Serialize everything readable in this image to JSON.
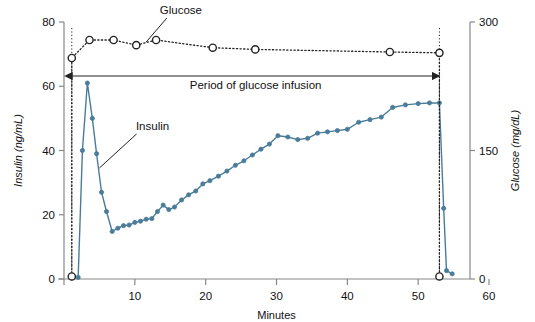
{
  "chart_data": {
    "type": "line",
    "title": "",
    "xlabel": "Minutes",
    "ylabel": "Insulin (ng/mL)",
    "y2label": "Glucose (mg/dL)",
    "xlim": [
      0,
      60
    ],
    "ylim": [
      0,
      80
    ],
    "y2lim": [
      0,
      300
    ],
    "xticks": [
      "10",
      "20",
      "30",
      "40",
      "50",
      "60"
    ],
    "xtick_values": [
      10,
      20,
      30,
      40,
      50,
      60
    ],
    "yticks": [
      "0",
      "20",
      "40",
      "60",
      "80"
    ],
    "ytick_values": [
      0,
      20,
      40,
      60,
      80
    ],
    "y2ticks": [
      "0",
      "150",
      "300"
    ],
    "y2tick_values": [
      0,
      150,
      300
    ],
    "grid": false,
    "legend_position": "inline-annotations",
    "series": [
      {
        "name": "Insulin",
        "axis": "left",
        "units": "ng/mL",
        "color": "#4a7c99",
        "marker": "filled-circle",
        "linestyle": "solid",
        "points": [
          [
            2.0,
            0.5
          ],
          [
            2.6,
            40.0
          ],
          [
            3.3,
            61.0
          ],
          [
            4.0,
            50.0
          ],
          [
            4.6,
            39.0
          ],
          [
            5.3,
            27.0
          ],
          [
            6.0,
            21.0
          ],
          [
            6.8,
            14.8
          ],
          [
            7.6,
            15.8
          ],
          [
            8.4,
            16.6
          ],
          [
            9.2,
            16.8
          ],
          [
            10.0,
            17.6
          ],
          [
            10.8,
            18.0
          ],
          [
            11.6,
            18.6
          ],
          [
            12.4,
            18.8
          ],
          [
            13.2,
            21.0
          ],
          [
            14.0,
            23.0
          ],
          [
            14.8,
            21.6
          ],
          [
            15.6,
            22.4
          ],
          [
            16.6,
            24.6
          ],
          [
            17.6,
            26.2
          ],
          [
            18.6,
            27.4
          ],
          [
            19.6,
            29.6
          ],
          [
            20.6,
            30.6
          ],
          [
            21.8,
            32.0
          ],
          [
            23.0,
            33.6
          ],
          [
            24.2,
            35.4
          ],
          [
            25.4,
            36.8
          ],
          [
            26.6,
            38.6
          ],
          [
            27.8,
            40.4
          ],
          [
            29.0,
            42.0
          ],
          [
            30.2,
            44.6
          ],
          [
            31.6,
            44.2
          ],
          [
            33.0,
            43.4
          ],
          [
            34.4,
            43.8
          ],
          [
            35.8,
            45.4
          ],
          [
            37.2,
            45.8
          ],
          [
            38.6,
            46.2
          ],
          [
            40.0,
            46.6
          ],
          [
            41.6,
            48.8
          ],
          [
            43.2,
            49.6
          ],
          [
            44.8,
            50.4
          ],
          [
            46.4,
            53.4
          ],
          [
            48.2,
            54.2
          ],
          [
            50.0,
            54.6
          ],
          [
            51.6,
            54.8
          ],
          [
            53.0,
            54.8
          ],
          [
            53.6,
            22.0
          ],
          [
            54.0,
            2.6
          ],
          [
            54.8,
            1.6
          ]
        ]
      },
      {
        "name": "Glucose",
        "axis": "right",
        "units": "mg/dL",
        "color": "#222222",
        "marker": "open-circle",
        "linestyle": "dotted",
        "points": [
          [
            1.1,
            3.0
          ],
          [
            1.1,
            258.0
          ],
          [
            3.6,
            279.0
          ],
          [
            7.0,
            279.0
          ],
          [
            10.2,
            273.0
          ],
          [
            13.0,
            279.0
          ],
          [
            21.0,
            270.0
          ],
          [
            27.0,
            268.0
          ],
          [
            46.0,
            265.0
          ],
          [
            53.0,
            264.0
          ],
          [
            53.0,
            3.0
          ]
        ]
      }
    ],
    "annotations": [
      {
        "name": "glucose-series-label",
        "text": "Glucose",
        "x": 16.5,
        "y_px": 14
      },
      {
        "name": "insulin-series-label",
        "text": "Insulin",
        "x": 12.5,
        "y_px": 130
      },
      {
        "name": "infusion-span-label",
        "text": "Period of glucose infusion",
        "x_start": 1.1,
        "x_end": 53.0,
        "y_px": 76
      }
    ]
  },
  "axes": {
    "left": {
      "title": "Insulin (ng/mL)"
    },
    "right": {
      "title": "Glucose (mg/dL)"
    },
    "bottom": {
      "title": "Minutes"
    }
  },
  "colors": {
    "insulin": "#4a7c99",
    "glucose": "#222222",
    "axis": "#888888",
    "text": "#111111"
  }
}
